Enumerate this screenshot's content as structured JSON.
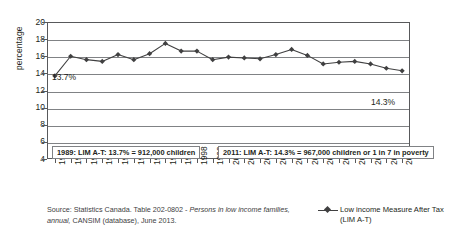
{
  "chart_data": {
    "type": "line",
    "title": "",
    "xlabel": "",
    "ylabel": "percentage",
    "ylim": [
      4,
      20
    ],
    "yticks": [
      4,
      6,
      8,
      10,
      12,
      14,
      16,
      18,
      20
    ],
    "grid": true,
    "legend_position": "bottom-right",
    "categories": [
      "1989",
      "1990",
      "1991",
      "1992",
      "1993",
      "1994",
      "1995",
      "1996",
      "1997",
      "1998",
      "1999",
      "2000",
      "2001",
      "2002",
      "2003",
      "2004",
      "2005",
      "2006",
      "2007",
      "2008",
      "2009",
      "2010",
      "2011"
    ],
    "series": [
      {
        "name": "Low income Measure After Tax (LIM A-T)",
        "marker": "diamond",
        "color": "#404041",
        "values": [
          13.7,
          16.0,
          15.6,
          15.4,
          16.2,
          15.6,
          16.3,
          17.5,
          16.6,
          16.6,
          15.6,
          15.9,
          15.8,
          15.7,
          16.2,
          16.8,
          16.1,
          15.1,
          15.3,
          15.4,
          15.1,
          14.6,
          14.3
        ]
      }
    ],
    "annotations": [
      {
        "id": "first-point",
        "text": "13.7%",
        "year": "1989",
        "value": 13.7
      },
      {
        "id": "last-point",
        "text": "14.3%",
        "year": "2011",
        "value": 14.3
      }
    ]
  },
  "axes": {
    "y_title": "percentage",
    "y_tick_labels": [
      "20",
      "18",
      "16",
      "14",
      "12",
      "10",
      "8",
      "6",
      "4"
    ],
    "x_tick_labels": [
      "1989",
      "1990",
      "1991",
      "1992",
      "1993",
      "1994",
      "1995",
      "1996",
      "1997",
      "1998",
      "1999",
      "2000",
      "2001",
      "2002",
      "2003",
      "2004",
      "2005",
      "2006",
      "2007",
      "2008",
      "2009",
      "2010",
      "2011"
    ]
  },
  "annotations": {
    "left_label": "13.7%",
    "right_label": "14.3%",
    "callout_1989": "1989: LIM A-T: 13.7% = 912,000 children",
    "callout_2011": "2011: LIM A-T: 14.3% = 967,000 children or 1 in 7 in poverty"
  },
  "source": {
    "line1_prefix": "Source: Statistics Canada. Table 202-0802 - ",
    "line1_italic": "Persons in low income families, annual,",
    "line2": "CANSIM (database), June 2013."
  },
  "legend": {
    "series_label": "Low income Measure After Tax",
    "series_sublabel": "(LIM A-T)"
  },
  "colors": {
    "series": "#404041",
    "grid": "#808285",
    "frame": "#58595b",
    "text": "#231f20",
    "background": "#ffffff"
  }
}
